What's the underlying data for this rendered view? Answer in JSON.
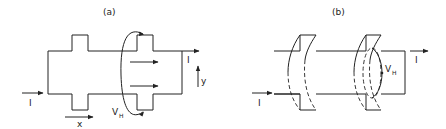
{
  "panels": [
    {
      "id": "a",
      "label": "(a)",
      "current_in": "I",
      "current_out": "I",
      "axis_x": "x",
      "axis_y": "y",
      "voltage_label": "V",
      "voltage_sub": "H"
    },
    {
      "id": "b",
      "label": "(b)",
      "current_in": "I",
      "current_out": "I",
      "voltage_label": "V",
      "voltage_sub": "H"
    }
  ],
  "colors": {
    "stroke": "#222222",
    "background": "#ffffff"
  }
}
